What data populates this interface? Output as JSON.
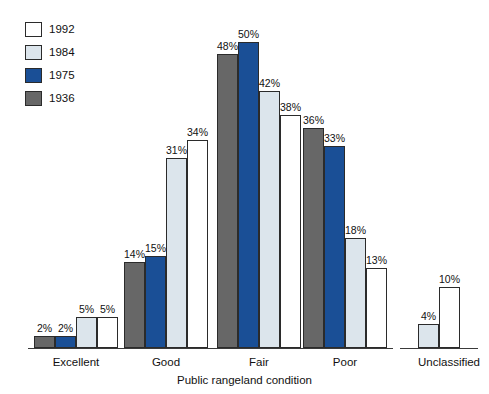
{
  "chart_data": {
    "type": "bar",
    "title": "",
    "subtitle": "",
    "xlabel": "Public rangeland condition",
    "ylabel": "",
    "ylim": [
      0,
      52
    ],
    "grid": false,
    "legend_position": "top-left",
    "value_suffix": "%",
    "categories": [
      "Excellent",
      "Good",
      "Fair",
      "Poor",
      "Unclassified"
    ],
    "series": [
      {
        "name": "1936",
        "color": "#676767",
        "values": [
          2,
          14,
          48,
          36,
          null
        ]
      },
      {
        "name": "1975",
        "color": "#1a4f96",
        "values": [
          2,
          15,
          50,
          33,
          null
        ]
      },
      {
        "name": "1984",
        "color": "#dce5ec",
        "values": [
          5,
          31,
          42,
          18,
          4
        ]
      },
      {
        "name": "1992",
        "color": "#ffffff",
        "values": [
          5,
          34,
          38,
          13,
          10
        ]
      }
    ],
    "legend_order": [
      "1992",
      "1984",
      "1975",
      "1936"
    ]
  },
  "legend": {
    "items": [
      {
        "label": "1992",
        "swatch": "#ffffff"
      },
      {
        "label": "1984",
        "swatch": "#dce5ec"
      },
      {
        "label": "1975",
        "swatch": "#1a4f96"
      },
      {
        "label": "1936",
        "swatch": "#676767"
      }
    ]
  },
  "axis": {
    "x_title": "Public rangeland condition"
  },
  "bars": {
    "excellent": [
      {
        "series": "1936",
        "value": "2%",
        "color": "#676767"
      },
      {
        "series": "1975",
        "value": "2%",
        "color": "#1a4f96"
      },
      {
        "series": "1984",
        "value": "5%",
        "color": "#dce5ec"
      },
      {
        "series": "1992",
        "value": "5%",
        "color": "#ffffff"
      }
    ],
    "good": [
      {
        "series": "1936",
        "value": "14%",
        "color": "#676767"
      },
      {
        "series": "1975",
        "value": "15%",
        "color": "#1a4f96"
      },
      {
        "series": "1984",
        "value": "31%",
        "color": "#dce5ec"
      },
      {
        "series": "1992",
        "value": "34%",
        "color": "#ffffff"
      }
    ],
    "fair": [
      {
        "series": "1936",
        "value": "48%",
        "color": "#676767"
      },
      {
        "series": "1975",
        "value": "50%",
        "color": "#1a4f96"
      },
      {
        "series": "1984",
        "value": "42%",
        "color": "#dce5ec"
      },
      {
        "series": "1992",
        "value": "38%",
        "color": "#ffffff"
      }
    ],
    "poor": [
      {
        "series": "1936",
        "value": "36%",
        "color": "#676767"
      },
      {
        "series": "1975",
        "value": "33%",
        "color": "#1a4f96"
      },
      {
        "series": "1984",
        "value": "18%",
        "color": "#dce5ec"
      },
      {
        "series": "1992",
        "value": "13%",
        "color": "#ffffff"
      }
    ],
    "unclassified": [
      {
        "series": "1984",
        "value": "4%",
        "color": "#dce5ec"
      },
      {
        "series": "1992",
        "value": "10%",
        "color": "#ffffff"
      }
    ]
  }
}
